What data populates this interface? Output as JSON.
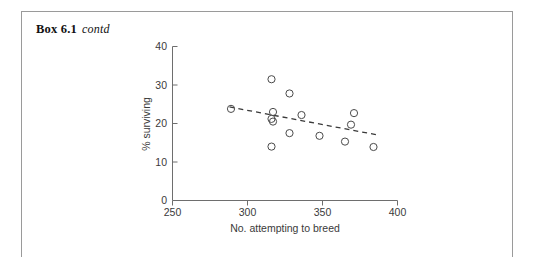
{
  "box": {
    "label": "Box 6.1",
    "continuation": "contd"
  },
  "chart_data": {
    "type": "scatter",
    "title": "",
    "xlabel": "No. attempting to breed",
    "ylabel": "% surviving",
    "xlim": [
      250,
      400
    ],
    "ylim": [
      0,
      40
    ],
    "xticks": [
      250,
      300,
      350,
      400
    ],
    "yticks": [
      0,
      10,
      20,
      30,
      40
    ],
    "grid": false,
    "legend": null,
    "marker": "open-circle",
    "points": [
      {
        "x": 289,
        "y": 23.8
      },
      {
        "x": 316,
        "y": 31.5
      },
      {
        "x": 328,
        "y": 27.8
      },
      {
        "x": 317,
        "y": 23.0
      },
      {
        "x": 316,
        "y": 21.2
      },
      {
        "x": 317,
        "y": 20.5
      },
      {
        "x": 336,
        "y": 22.2
      },
      {
        "x": 328,
        "y": 17.5
      },
      {
        "x": 348,
        "y": 16.8
      },
      {
        "x": 316,
        "y": 14.0
      },
      {
        "x": 371,
        "y": 22.7
      },
      {
        "x": 369,
        "y": 19.7
      },
      {
        "x": 365,
        "y": 15.3
      },
      {
        "x": 384,
        "y": 13.9
      }
    ],
    "trendline": {
      "style": "dashed",
      "x_start": 288,
      "y_start": 24.3,
      "x_end": 387,
      "y_end": 17.0
    },
    "colors": {
      "marker_stroke": "#4a4a4a",
      "trend": "#3a3a3a",
      "axis": "#6e6e6e",
      "text": "#3a3a3a",
      "frame": "#9a9a9a",
      "background": "#ffffff"
    }
  }
}
